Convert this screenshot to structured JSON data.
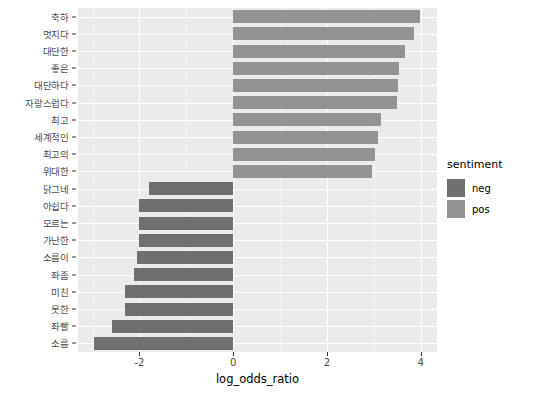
{
  "chart_data": {
    "type": "bar",
    "orientation": "horizontal",
    "title": "",
    "xlabel": "log_odds_ratio",
    "ylabel": "",
    "xlim": [
      -3.31,
      4.35
    ],
    "xticks": [
      -2,
      0,
      2,
      4
    ],
    "xtick_labels": [
      "-2",
      "0",
      "2",
      "4"
    ],
    "grid": true,
    "grid_minor_x": [
      -3,
      -1,
      1,
      3
    ],
    "legend": {
      "title": "sentiment",
      "position": "right",
      "entries": [
        {
          "label": "neg",
          "color": "#6f6f6f"
        },
        {
          "label": "pos",
          "color": "#939393"
        }
      ]
    },
    "categories": [
      "축하",
      "멋지다",
      "대단한",
      "좋은",
      "대단하다",
      "자랑스럽다",
      "최고",
      "세계적인",
      "최고의",
      "위대한",
      "닭그네",
      "아쉽다",
      "모르는",
      "가난한",
      "소름이",
      "좌좀",
      "미친",
      "못한",
      "좌빨",
      "소름"
    ],
    "values": [
      3.98,
      3.86,
      3.67,
      3.55,
      3.53,
      3.49,
      3.16,
      3.1,
      3.02,
      2.96,
      -1.8,
      -2.0,
      -2.0,
      -2.02,
      -2.06,
      -2.12,
      -2.3,
      -2.3,
      -2.59,
      -2.98
    ],
    "groups": [
      "pos",
      "pos",
      "pos",
      "pos",
      "pos",
      "pos",
      "pos",
      "pos",
      "pos",
      "pos",
      "neg",
      "neg",
      "neg",
      "neg",
      "neg",
      "neg",
      "neg",
      "neg",
      "neg",
      "neg"
    ]
  },
  "colors": {
    "panel_background": "#ebebeb",
    "grid_major": "#ffffff",
    "grid_minor": "#f5f5f5",
    "neg": "#6f6f6f",
    "pos": "#939393",
    "page_background": "#ffffff",
    "axis_text": "#4d4d4d"
  }
}
